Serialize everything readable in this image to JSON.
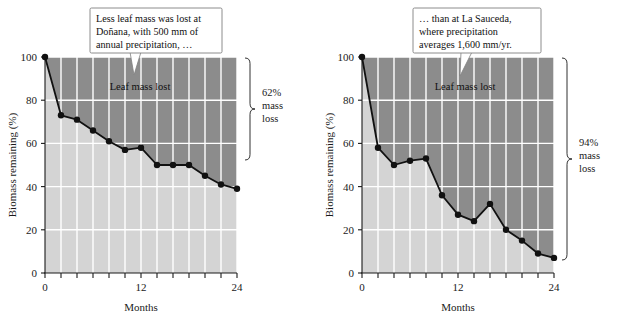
{
  "figure": {
    "background_color": "#ffffff",
    "remaining_fill_color": "#d4d4d4",
    "lost_fill_color": "#8c8c8c",
    "line_color": "#111111",
    "gridline_color": "#ffffff",
    "axis_color": "#1a1a1a",
    "callout_fill_color": "#ffffff",
    "callout_border_color": "#808080"
  },
  "panels": [
    {
      "id": "dona-na",
      "callout": {
        "lines": [
          "Less leaf mass was lost at",
          "Doñana, with 500 mm of",
          "annual precipitation, …"
        ]
      },
      "inplot_label": "Leaf mass lost",
      "bracket": {
        "lines": [
          "62%",
          "mass",
          "loss"
        ]
      },
      "axes": {
        "ylabel": "Biomass remaining (%)",
        "xlabel": "Months",
        "yticks": [
          0,
          20,
          40,
          60,
          80,
          100
        ],
        "ytick_labels": [
          "0",
          "20",
          "40",
          "60",
          "80",
          "100"
        ],
        "xticks": [
          0,
          2,
          4,
          6,
          8,
          10,
          12,
          14,
          16,
          18,
          20,
          22,
          24
        ],
        "xtick_labels_shown": {
          "0": "0",
          "12": "12",
          "24": "24"
        }
      }
    },
    {
      "id": "la-sauceda",
      "callout": {
        "lines": [
          "… than at La Sauceda,",
          "where precipitation",
          "averages 1,600 mm/yr."
        ]
      },
      "inplot_label": "Leaf mass lost",
      "bracket": {
        "lines": [
          "94%",
          "mass",
          "loss"
        ]
      },
      "axes": {
        "ylabel": "Biomass remaining (%)",
        "xlabel": "Months",
        "yticks": [
          0,
          20,
          40,
          60,
          80,
          100
        ],
        "ytick_labels": [
          "0",
          "20",
          "40",
          "60",
          "80",
          "100"
        ],
        "xticks": [
          0,
          2,
          4,
          6,
          8,
          10,
          12,
          14,
          16,
          18,
          20,
          22,
          24
        ],
        "xtick_labels_shown": {
          "0": "0",
          "12": "12",
          "24": "24"
        }
      }
    }
  ],
  "chart_data": [
    {
      "type": "line",
      "title": "Doñana",
      "xlabel": "Months",
      "ylabel": "Biomass remaining (%)",
      "xlim": [
        0,
        24
      ],
      "ylim": [
        0,
        100
      ],
      "xticks": [
        0,
        2,
        4,
        6,
        8,
        10,
        12,
        14,
        16,
        18,
        20,
        22,
        24
      ],
      "yticks": [
        0,
        20,
        40,
        60,
        80,
        100
      ],
      "grid": true,
      "legend": false,
      "annotations": [
        "Less leaf mass was lost at Doñana, with 500 mm of annual precipitation, …",
        "Leaf mass lost",
        "62% mass loss"
      ],
      "series": [
        {
          "name": "Biomass remaining at Doñana",
          "x": [
            0,
            2,
            4,
            6,
            8,
            10,
            12,
            14,
            16,
            18,
            20,
            22,
            24
          ],
          "values": [
            100,
            73,
            71,
            66,
            61,
            57,
            58,
            50,
            50,
            50,
            45,
            41,
            39
          ]
        }
      ]
    },
    {
      "type": "line",
      "title": "La Sauceda",
      "xlabel": "Months",
      "ylabel": "Biomass remaining (%)",
      "xlim": [
        0,
        24
      ],
      "ylim": [
        0,
        100
      ],
      "xticks": [
        0,
        2,
        4,
        6,
        8,
        10,
        12,
        14,
        16,
        18,
        20,
        22,
        24
      ],
      "yticks": [
        0,
        20,
        40,
        60,
        80,
        100
      ],
      "grid": true,
      "legend": false,
      "annotations": [
        "… than at La Sauceda, where precipitation averages 1,600 mm/yr.",
        "Leaf mass lost",
        "94% mass loss"
      ],
      "series": [
        {
          "name": "Biomass remaining at La Sauceda",
          "x": [
            0,
            2,
            4,
            6,
            8,
            10,
            12,
            14,
            16,
            18,
            20,
            22,
            24
          ],
          "values": [
            100,
            58,
            50,
            52,
            53,
            36,
            27,
            24,
            32,
            20,
            15,
            9,
            7
          ]
        }
      ]
    }
  ]
}
